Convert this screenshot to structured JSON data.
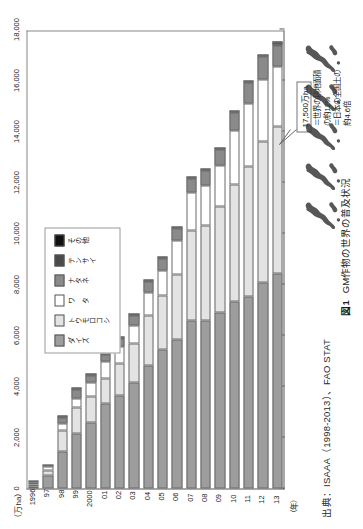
{
  "figure": {
    "unit_label": "（万ha）",
    "source": "出典：ISAAA（1998-2013）、FAO STAT",
    "caption_number": "図1",
    "caption_text": "GM作物の世界の普及状況",
    "year_axis_label": "（年）",
    "callout_value": "17,500万ha",
    "notes": [
      "＝世界の耕地面積",
      "の約12%",
      "＝日本の全国土の",
      "約4.6倍"
    ],
    "japan_icon_name": "japan-map-silhouette",
    "japan_icon_count": 5
  },
  "chart_data": {
    "type": "bar",
    "orientation": "horizontal-stacked",
    "title": "GM作物の世界の普及状況",
    "xlabel": "（万ha）",
    "ylabel": "（年）",
    "xlim": [
      0,
      18000
    ],
    "xticks": [
      0,
      2000,
      4000,
      6000,
      8000,
      10000,
      12000,
      14000,
      16000,
      18000
    ],
    "xticklabels": [
      "0",
      "2,000",
      "4,000",
      "6,000",
      "8,000",
      "10,000",
      "12,000",
      "14,000",
      "16,000",
      "18,000"
    ],
    "grid": false,
    "legend_position": "upper-center",
    "categories": [
      "1996",
      "97",
      "98",
      "99",
      "2000",
      "01",
      "02",
      "03",
      "04",
      "05",
      "06",
      "07",
      "08",
      "09",
      "10",
      "11",
      "12",
      "13"
    ],
    "series": [
      {
        "name": "ダイズ",
        "color": "#9d9d9d",
        "values": [
          50,
          510,
          1450,
          2150,
          2580,
          3330,
          3650,
          4150,
          4840,
          5440,
          5860,
          6580,
          6590,
          6900,
          7330,
          7540,
          8070,
          8450
        ]
      },
      {
        "name": "トウモロコシ",
        "color": "#e3e3e3",
        "values": [
          30,
          210,
          830,
          1030,
          1030,
          970,
          1240,
          1540,
          1930,
          2140,
          2520,
          3520,
          3730,
          4170,
          4600,
          5100,
          5550,
          5730
        ]
      },
      {
        "name": "ワ タ",
        "color": "#ffffff",
        "values": [
          80,
          140,
          250,
          360,
          530,
          680,
          680,
          720,
          900,
          980,
          1340,
          1500,
          1550,
          1600,
          2100,
          2470,
          2430,
          2370
        ]
      },
      {
        "name": "ナタネ",
        "color": "#8a8a8a",
        "values": [
          10,
          100,
          240,
          350,
          290,
          270,
          300,
          360,
          430,
          460,
          480,
          550,
          590,
          640,
          700,
          820,
          910,
          820
        ]
      },
      {
        "name": "テンサイ",
        "color": "#4a4a4a",
        "values": [
          0,
          0,
          10,
          10,
          10,
          10,
          10,
          10,
          10,
          10,
          20,
          30,
          40,
          50,
          50,
          50,
          50,
          50
        ]
      },
      {
        "name": "その他",
        "color": "#111111",
        "values": [
          0,
          0,
          0,
          0,
          0,
          0,
          0,
          0,
          0,
          0,
          0,
          0,
          0,
          0,
          0,
          0,
          0,
          80
        ]
      }
    ],
    "totals": [
      170,
      960,
      2780,
      3900,
      4440,
      5260,
      5880,
      6780,
      8110,
      9030,
      10220,
      12180,
      12500,
      13360,
      14780,
      15980,
      17010,
      17500
    ],
    "annotations": [
      {
        "target_category": "13",
        "label": "17,500万ha"
      }
    ]
  }
}
